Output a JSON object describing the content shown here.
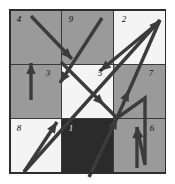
{
  "figure": {
    "type": "grid-arrow-diagram",
    "grid": {
      "rows": 3,
      "cols": 3,
      "origin_x": 10,
      "origin_y": 10,
      "cell_width": 51.7,
      "cell_height": 54.3,
      "line_color": "#3a3a3a",
      "border_color": "#2e2e2e"
    },
    "palette": {
      "background": "#ffffff",
      "gray_medium": "#9a9a9a",
      "gray_light": "#a8a8a8",
      "white": "#f4f4f4",
      "dark": "#2b2b2b",
      "arrow": "#3b3b3b"
    },
    "cells": [
      {
        "number": "4",
        "row": 0,
        "col": 0,
        "fill": "#9a9a9a",
        "label_dark": false,
        "label_x": 19,
        "label_y": 22
      },
      {
        "number": "9",
        "row": 0,
        "col": 1,
        "fill": "#9a9a9a",
        "label_dark": false,
        "label_x": 71,
        "label_y": 22
      },
      {
        "number": "2",
        "row": 0,
        "col": 2,
        "fill": "#f4f4f4",
        "label_dark": false,
        "label_x": 124,
        "label_y": 22
      },
      {
        "number": "3",
        "row": 1,
        "col": 0,
        "fill": "#9a9a9a",
        "label_dark": false,
        "label_x": 48,
        "label_y": 76
      },
      {
        "number": "5",
        "row": 1,
        "col": 1,
        "fill": "#f4f4f4",
        "label_dark": false,
        "label_x": 100,
        "label_y": 76
      },
      {
        "number": "7",
        "row": 1,
        "col": 2,
        "fill": "#9a9a9a",
        "label_dark": false,
        "label_x": 151,
        "label_y": 76
      },
      {
        "number": "8",
        "row": 2,
        "col": 0,
        "fill": "#f4f4f4",
        "label_dark": false,
        "label_x": 19,
        "label_y": 131
      },
      {
        "number": "1",
        "row": 2,
        "col": 2,
        "fill": "#2b2b2b",
        "label_dark": true,
        "label_x": 71,
        "label_y": 131
      },
      {
        "number": "6",
        "row": 2,
        "col": 2,
        "fill": "#9a9a9a",
        "label_dark": false,
        "label_x": 152,
        "label_y": 131
      }
    ],
    "arrows": [
      {
        "name": "arrow-4-to-5",
        "from_cell": "4",
        "to_cell": "5",
        "points": "31,16 72,59",
        "head_at": "72,59",
        "head_angle": 46
      },
      {
        "name": "arrow-3-up",
        "from_cell": "3",
        "to_cell": "4",
        "points": "31,100 31,63",
        "head_at": "31,63",
        "head_angle": -90
      },
      {
        "name": "arrow-9-to-2",
        "from_cell": "9",
        "to_cell": "2",
        "points": "102,18 60,83",
        "head_at": "60,83",
        "head_angle": 123
      },
      {
        "name": "arrow-8-to-2",
        "from_cell": "8",
        "to_cell": "2",
        "points": "24,172 160,20",
        "head_at": "160,20",
        "head_angle": -48
      },
      {
        "name": "arrow-2-to-5",
        "from_cell": "2",
        "to_cell": "5",
        "points": "159,22 100,71",
        "head_at": "100,71",
        "head_angle": 140
      },
      {
        "name": "arrow-5-to-1",
        "from_cell": "5",
        "to_cell": "1",
        "points": "61,62 117,118",
        "head_at": "104,105",
        "head_angle": 45
      },
      {
        "name": "arrow-8-to-4",
        "from_cell": "8",
        "to_cell": "4",
        "points": "24,172 57,122",
        "head_at": "57,122",
        "head_angle": -57
      },
      {
        "name": "arrow-1-to-center",
        "from_cell": "1",
        "to_cell": "5",
        "points": "89,177 117,118",
        "head_at": "117,118",
        "head_angle": -65
      },
      {
        "name": "arrow-7-to-2",
        "from_cell": "7",
        "to_cell": "2",
        "points": "117,118 160,20",
        "head_at": "129,90",
        "head_angle": -66
      },
      {
        "name": "arrow-7-zigzag",
        "from_cell": "7",
        "to_cell": "6",
        "points": "117,118 145,98 145,165 137,127",
        "head_at": "137,127",
        "head_angle": -100
      },
      {
        "name": "arrow-6-up",
        "from_cell": "6",
        "to_cell": "7",
        "points": "137,168 137,127",
        "head_at": "137,127",
        "head_angle": -90
      }
    ]
  }
}
